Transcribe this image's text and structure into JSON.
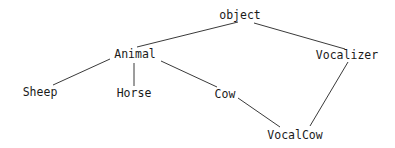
{
  "diagram": {
    "type": "class-inheritance-hierarchy",
    "nodes": [
      {
        "id": "object",
        "label": "object",
        "x": 240,
        "y": 19
      },
      {
        "id": "animal",
        "label": "Animal",
        "x": 135,
        "y": 58
      },
      {
        "id": "vocalizer",
        "label": "Vocalizer",
        "x": 347,
        "y": 59
      },
      {
        "id": "sheep",
        "label": "Sheep",
        "x": 40,
        "y": 96
      },
      {
        "id": "horse",
        "label": "Horse",
        "x": 134,
        "y": 97
      },
      {
        "id": "cow",
        "label": "Cow",
        "x": 225,
        "y": 98
      },
      {
        "id": "vocalcow",
        "label": "VocalCow",
        "x": 295,
        "y": 139
      }
    ],
    "edges": [
      {
        "from": "object",
        "to": "animal",
        "x1": 238,
        "y1": 22,
        "x2": 137,
        "y2": 47
      },
      {
        "from": "object",
        "to": "vocalizer",
        "x1": 254,
        "y1": 23,
        "x2": 345,
        "y2": 49
      },
      {
        "from": "animal",
        "to": "sheep",
        "x1": 110,
        "y1": 59,
        "x2": 53,
        "y2": 85
      },
      {
        "from": "animal",
        "to": "horse",
        "x1": 134,
        "y1": 63,
        "x2": 134,
        "y2": 86
      },
      {
        "from": "animal",
        "to": "cow",
        "x1": 161,
        "y1": 61,
        "x2": 217,
        "y2": 87
      },
      {
        "from": "cow",
        "to": "vocalcow",
        "x1": 238,
        "y1": 98,
        "x2": 280,
        "y2": 127
      },
      {
        "from": "vocalizer",
        "to": "vocalcow",
        "x1": 348,
        "y1": 62,
        "x2": 310,
        "y2": 126
      }
    ]
  }
}
